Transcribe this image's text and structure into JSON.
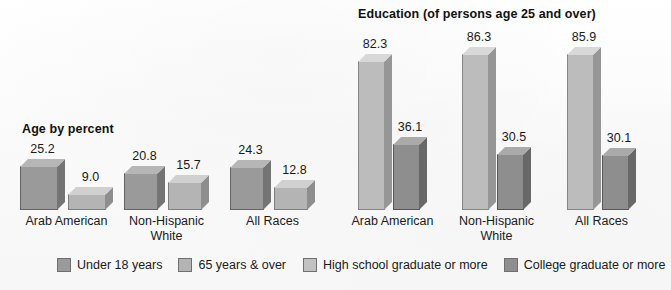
{
  "chart_data": [
    {
      "type": "bar",
      "title": "Age by percent",
      "categories": [
        "Arab American",
        "Non-Hispanic\nWhite",
        "All Races"
      ],
      "series": [
        {
          "name": "Under 18 years",
          "values": [
            25.2,
            20.8,
            24.3
          ],
          "color": "#9a9a9a"
        },
        {
          "name": "65 years & over",
          "values": [
            9.0,
            15.7,
            12.8
          ],
          "color": "#b4b4b4"
        }
      ],
      "xlabel": "",
      "ylabel": "",
      "ylim": [
        0,
        90
      ],
      "grid": false,
      "legend_position": "bottom"
    },
    {
      "type": "bar",
      "title": "Education (of persons age 25 and over)",
      "categories": [
        "Arab American",
        "Non-Hispanic\nWhite",
        "All Races"
      ],
      "series": [
        {
          "name": "High school graduate or more",
          "values": [
            82.3,
            86.3,
            85.9
          ],
          "color": "#bcbcbc"
        },
        {
          "name": "College graduate or more",
          "values": [
            36.1,
            30.5,
            30.1
          ],
          "color": "#8e8e8e"
        }
      ],
      "xlabel": "",
      "ylabel": "",
      "ylim": [
        0,
        90
      ],
      "grid": false,
      "legend_position": "bottom"
    }
  ],
  "age_chart": {
    "title": "Age by percent",
    "groups": [
      {
        "label": "Arab American",
        "bars": [
          {
            "value": "25.2",
            "series": "Under 18 years"
          },
          {
            "value": "9.0",
            "series": "65 years & over"
          }
        ]
      },
      {
        "label": "Non-Hispanic\nWhite",
        "bars": [
          {
            "value": "20.8",
            "series": "Under 18 years"
          },
          {
            "value": "15.7",
            "series": "65 years & over"
          }
        ]
      },
      {
        "label": "All Races",
        "bars": [
          {
            "value": "24.3",
            "series": "Under 18 years"
          },
          {
            "value": "12.8",
            "series": "65 years & over"
          }
        ]
      }
    ]
  },
  "education_chart": {
    "title": "Education (of persons age 25 and over)",
    "groups": [
      {
        "label": "Arab American",
        "bars": [
          {
            "value": "82.3",
            "series": "High school graduate or more"
          },
          {
            "value": "36.1",
            "series": "College graduate or more"
          }
        ]
      },
      {
        "label": "Non-Hispanic\nWhite",
        "bars": [
          {
            "value": "86.3",
            "series": "High school graduate or more"
          },
          {
            "value": "30.5",
            "series": "College graduate or more"
          }
        ]
      },
      {
        "label": "All Races",
        "bars": [
          {
            "value": "85.9",
            "series": "High school graduate or more"
          },
          {
            "value": "30.1",
            "series": "College graduate or more"
          }
        ]
      }
    ]
  },
  "legend": {
    "age": [
      {
        "label": "Under 18 years",
        "color": "#9a9a9a"
      },
      {
        "label": "65 years & over",
        "color": "#b4b4b4"
      }
    ],
    "education": [
      {
        "label": "High school graduate or more",
        "color": "#c2c2c2"
      },
      {
        "label": "College graduate or more",
        "color": "#8e8e8e"
      }
    ]
  },
  "colors": {
    "under18_front": "#9a9a9a",
    "under18_side": "#747474",
    "under18_top": "#b9b9b9",
    "over65_front": "#b4b4b4",
    "over65_side": "#8c8c8c",
    "over65_top": "#cfcfcf",
    "hs_front": "#bcbcbc",
    "hs_side": "#949494",
    "hs_top": "#d4d4d4",
    "college_front": "#8e8e8e",
    "college_side": "#6a6a6a",
    "college_top": "#ababab",
    "background": "#fbfbfb",
    "text": "#1a1a1a"
  }
}
